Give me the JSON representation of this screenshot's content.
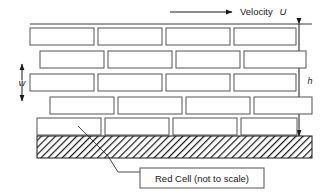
{
  "figure": {
    "width": 334,
    "height": 194,
    "background": "#ffffff",
    "line_color": "#1a1a1a",
    "cell_stroke": "#555555",
    "cell_fill": "#ffffff"
  },
  "annotations": {
    "velocity_label": "Velocity",
    "velocity_symbol": "U",
    "width_symbol": "w",
    "height_symbol": "h",
    "caption": "Red Cell (not to scale)"
  },
  "chart_data": {
    "type": "diagram",
    "title": "Red Cell (not to scale)",
    "top_reference_line": {
      "x1": 30,
      "x2": 312,
      "y": 24
    },
    "velocity_arrow": {
      "x1": 170,
      "x2": 232,
      "y": 12,
      "direction": "right"
    },
    "height_dimension": {
      "symbol": "h",
      "x": 299,
      "y_top": 24,
      "y_bottom": 136,
      "label_x": 310,
      "label_y": 84
    },
    "width_dimension": {
      "symbol": "w",
      "x": 22,
      "y_top": 64,
      "y_bottom": 101,
      "label_x": 22,
      "label_y": 85
    },
    "wall": {
      "x": 37,
      "y": 136,
      "width": 275,
      "height": 22,
      "pattern": "diagonal-hatch"
    },
    "caption_box": {
      "x": 140,
      "y": 168,
      "width": 124,
      "height": 20
    },
    "leader_line": {
      "points": "78,126 108,156 118,172 140,172"
    },
    "cell_rows": [
      {
        "row": 1,
        "y": 28,
        "height": 17,
        "cells": [
          {
            "x": 30,
            "width": 64
          },
          {
            "x": 98,
            "width": 64
          },
          {
            "x": 166,
            "width": 64
          },
          {
            "x": 234,
            "width": 62
          }
        ]
      },
      {
        "row": 2,
        "y": 51,
        "height": 17,
        "cells": [
          {
            "x": 40,
            "width": 64
          },
          {
            "x": 108,
            "width": 64
          },
          {
            "x": 176,
            "width": 64
          },
          {
            "x": 244,
            "width": 62
          }
        ]
      },
      {
        "row": 3,
        "y": 74,
        "height": 17,
        "cells": [
          {
            "x": 30,
            "width": 64
          },
          {
            "x": 98,
            "width": 64
          },
          {
            "x": 166,
            "width": 64
          },
          {
            "x": 234,
            "width": 62
          }
        ]
      },
      {
        "row": 4,
        "y": 97,
        "height": 17,
        "cells": [
          {
            "x": 50,
            "width": 64
          },
          {
            "x": 118,
            "width": 64
          },
          {
            "x": 186,
            "width": 64
          },
          {
            "x": 254,
            "width": 58
          }
        ]
      },
      {
        "row": 5,
        "y": 118,
        "height": 17,
        "cells": [
          {
            "x": 37,
            "width": 64
          },
          {
            "x": 105,
            "width": 64
          },
          {
            "x": 173,
            "width": 64
          },
          {
            "x": 241,
            "width": 56
          }
        ]
      }
    ],
    "counts": {
      "rows": 5,
      "cells_per_row": 4,
      "total_cells": 20
    }
  }
}
